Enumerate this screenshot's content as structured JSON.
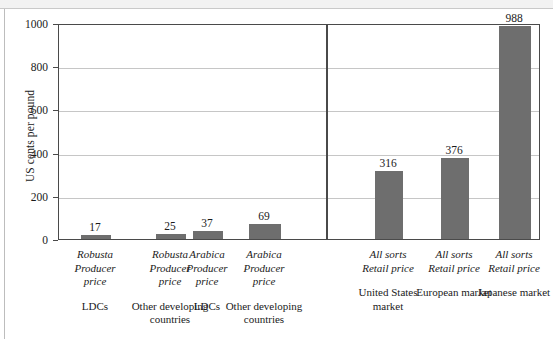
{
  "chart_data": {
    "type": "bar",
    "title": "",
    "subtitle": "",
    "xlabel": "",
    "ylabel": "US cents per pound",
    "ylim": [
      0,
      1000
    ],
    "yticks": [
      0,
      200,
      400,
      600,
      800,
      1000
    ],
    "ytick_labels": [
      "0",
      "200",
      "400",
      "600",
      "800",
      "1000"
    ],
    "grid": true,
    "legend": "none",
    "bar_color": "#6e6e6e",
    "panel_divider_after_index": 3,
    "categories": [
      "Robusta Producer price LDCs",
      "Robusta Producer price Other developing countries",
      "Arabica Producer price LDCs",
      "Arabica Producer price Other developing countries",
      "All sorts Retail price United States market",
      "All sorts Retail price European market",
      "All sorts Retail price Japanese market"
    ],
    "values": [
      17,
      25,
      37,
      69,
      316,
      376,
      988
    ],
    "bars": [
      {
        "value": 17,
        "value_label": "17",
        "line1": "Robusta",
        "line2": "Producer",
        "line3": "price",
        "group": "LDCs",
        "panel": "producer"
      },
      {
        "value": 25,
        "value_label": "25",
        "line1": "Robusta",
        "line2": "Producer",
        "line3": "price",
        "group": "Other developing countries",
        "panel": "producer"
      },
      {
        "value": 37,
        "value_label": "37",
        "line1": "Arabica",
        "line2": "Producer",
        "line3": "price",
        "group": "LDCs",
        "panel": "producer"
      },
      {
        "value": 69,
        "value_label": "69",
        "line1": "Arabica",
        "line2": "Producer",
        "line3": "price",
        "group": "Other developing countries",
        "panel": "producer"
      },
      {
        "value": 316,
        "value_label": "316",
        "line1": "All sorts",
        "line2": "Retail price",
        "line3": "",
        "group": "United States market",
        "panel": "retail"
      },
      {
        "value": 376,
        "value_label": "376",
        "line1": "All sorts",
        "line2": "Retail price",
        "line3": "",
        "group": "European market",
        "panel": "retail"
      },
      {
        "value": 988,
        "value_label": "988",
        "line1": "All sorts",
        "line2": "Retail price",
        "line3": "",
        "group": "Japanese market",
        "panel": "retail"
      }
    ]
  }
}
